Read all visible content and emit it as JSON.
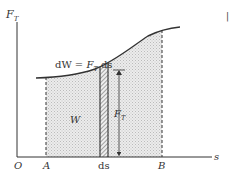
{
  "diagram": {
    "axes": {
      "y_label": "F",
      "y_label_sub": "T",
      "x_label": "s",
      "origin_label": "O"
    },
    "points": {
      "a_label": "A",
      "b_label": "B",
      "ds_label": "ds"
    },
    "equation": {
      "lhs": "dW = ",
      "force": "F",
      "force_sub": "T",
      "rhs": " ds"
    },
    "area_label": "W",
    "height_label": "F",
    "height_label_sub": "T",
    "corner_mark": "|",
    "colors": {
      "ink": "#333333",
      "fill": "#e6e6e6",
      "background": "#ffffff"
    }
  }
}
